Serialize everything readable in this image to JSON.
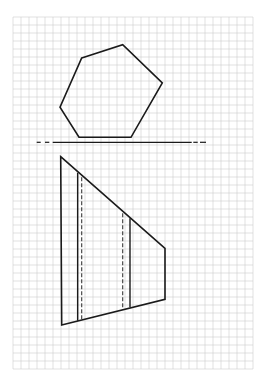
{
  "canvas": {
    "width": 269,
    "height": 383,
    "background": "#ffffff"
  },
  "grid": {
    "x": 13,
    "y": 17,
    "width": 240,
    "height": 352,
    "cell": 8,
    "color": "#cfcfcf",
    "stroke_width": 0.6
  },
  "colors": {
    "line": "#1a1a1a",
    "hidden": "#3a3a3a"
  },
  "top_view": {
    "label": "pentagon-top-view",
    "points": [
      [
        81.7,
        58
      ],
      [
        122.7,
        44.7
      ],
      [
        162.3,
        83
      ],
      [
        131,
        137.3
      ],
      [
        79,
        137.3
      ],
      [
        60,
        107.3
      ]
    ]
  },
  "cut_line": {
    "y": 142.3,
    "solid": [
      52.7,
      191.7
    ],
    "dashes": [
      [
        36.7,
        40.7
      ],
      [
        45,
        49.3
      ],
      [
        193.3,
        197.7
      ],
      [
        200,
        206
      ]
    ]
  },
  "front_view": {
    "outline": [
      [
        60.7,
        156.7
      ],
      [
        165,
        248.3
      ],
      [
        165,
        299.3
      ],
      [
        61.7,
        325
      ]
    ],
    "visible_edges": [
      {
        "x": 77.7,
        "y1": 172.7,
        "y2": 320.7
      },
      {
        "x": 130,
        "y1": 218.3,
        "y2": 307.3
      }
    ],
    "hidden_edges": [
      {
        "x": 81.7,
        "y1": 177.3,
        "y2": 319.3
      },
      {
        "x": 122.7,
        "y1": 213.3,
        "y2": 309.3
      }
    ]
  }
}
